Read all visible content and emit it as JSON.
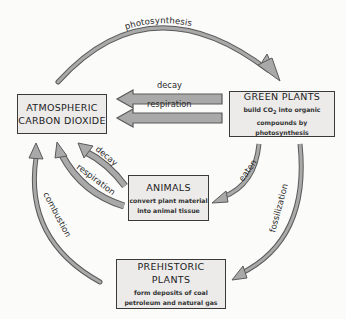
{
  "nodes": {
    "atmospheric": {
      "title_line1": "ATMOSPHERIC",
      "title_line2": "CARBON DIOXIDE"
    },
    "green_plants": {
      "title": "GREEN PLANTS",
      "desc_line1_a": "build  CO",
      "desc_line1_sub": "2",
      "desc_line1_b": " into organic",
      "desc_line2": "compounds by photosynthesis"
    },
    "animals": {
      "title": "ANIMALS",
      "desc_line1": "convert plant material",
      "desc_line2": "into animal tissue"
    },
    "prehistoric_plants": {
      "title": "PREHISTORIC PLANTS",
      "desc_line1": "form deposits of coal",
      "desc_line2": "petroleum and natural gas"
    }
  },
  "edges": {
    "photosynthesis": "photosynthesis",
    "plants_decay": "decay",
    "plants_respiration": "respiration",
    "animals_decay": "decay",
    "animals_respiration": "respiration",
    "combustion": "combustion",
    "eaten": "eaten",
    "fossilization": "fossilization"
  },
  "colors": {
    "arrow_fill": "#a9a9a9",
    "arrow_stroke": "#5a5a5a",
    "box_fill": "#ecebea",
    "box_border": "#3a3a3a",
    "background": "#fbfbfa"
  }
}
